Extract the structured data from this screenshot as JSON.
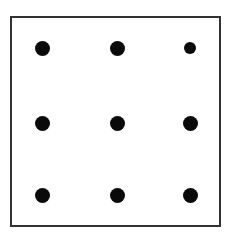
{
  "diagram": {
    "title": "",
    "frame_color": "#333333",
    "dot_color": "#0a0a0a",
    "dots": [
      {
        "row": 0,
        "col": 0,
        "x": 42,
        "y": 48,
        "size": 15
      },
      {
        "row": 0,
        "col": 1,
        "x": 117,
        "y": 48,
        "size": 15
      },
      {
        "row": 0,
        "col": 2,
        "x": 190,
        "y": 48,
        "size": 12
      },
      {
        "row": 1,
        "col": 0,
        "x": 42,
        "y": 123,
        "size": 15
      },
      {
        "row": 1,
        "col": 1,
        "x": 117,
        "y": 123,
        "size": 15
      },
      {
        "row": 1,
        "col": 2,
        "x": 190,
        "y": 123,
        "size": 15
      },
      {
        "row": 2,
        "col": 0,
        "x": 42,
        "y": 195,
        "size": 15
      },
      {
        "row": 2,
        "col": 1,
        "x": 117,
        "y": 195,
        "size": 15
      },
      {
        "row": 2,
        "col": 2,
        "x": 190,
        "y": 195,
        "size": 15
      }
    ]
  }
}
